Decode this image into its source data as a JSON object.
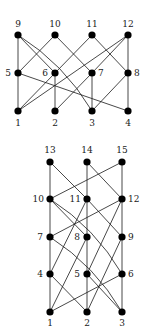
{
  "graphs": [
    {
      "id": "top",
      "nodes": [
        {
          "id": "1",
          "x": 18,
          "y": 111,
          "label": "1",
          "lx": 18,
          "ly": 126,
          "anchor": "middle"
        },
        {
          "id": "2",
          "x": 55,
          "y": 111,
          "label": "2",
          "lx": 55,
          "ly": 126,
          "anchor": "middle"
        },
        {
          "id": "3",
          "x": 92,
          "y": 111,
          "label": "3",
          "lx": 92,
          "ly": 126,
          "anchor": "middle"
        },
        {
          "id": "4",
          "x": 128,
          "y": 111,
          "label": "4",
          "lx": 128,
          "ly": 126,
          "anchor": "middle"
        },
        {
          "id": "5",
          "x": 18,
          "y": 73,
          "label": "5",
          "lx": 11,
          "ly": 76,
          "anchor": "end"
        },
        {
          "id": "6",
          "x": 55,
          "y": 73,
          "label": "6",
          "lx": 48,
          "ly": 76,
          "anchor": "end"
        },
        {
          "id": "7",
          "x": 92,
          "y": 73,
          "label": "7",
          "lx": 98,
          "ly": 76,
          "anchor": "start"
        },
        {
          "id": "8",
          "x": 128,
          "y": 73,
          "label": "8",
          "lx": 134,
          "ly": 76,
          "anchor": "start"
        },
        {
          "id": "9",
          "x": 18,
          "y": 35,
          "label": "9",
          "lx": 18,
          "ly": 27,
          "anchor": "middle"
        },
        {
          "id": "10",
          "x": 55,
          "y": 35,
          "label": "10",
          "lx": 55,
          "ly": 27,
          "anchor": "middle"
        },
        {
          "id": "11",
          "x": 92,
          "y": 35,
          "label": "11",
          "lx": 92,
          "ly": 27,
          "anchor": "middle"
        },
        {
          "id": "12",
          "x": 128,
          "y": 35,
          "label": "12",
          "lx": 128,
          "ly": 27,
          "anchor": "middle"
        }
      ],
      "edges": [
        [
          "9",
          "5"
        ],
        [
          "9",
          "6"
        ],
        [
          "9",
          "3",
          "curve"
        ],
        [
          "10",
          "5"
        ],
        [
          "10",
          "7"
        ],
        [
          "11",
          "6"
        ],
        [
          "11",
          "8"
        ],
        [
          "12",
          "8"
        ],
        [
          "12",
          "7"
        ],
        [
          "12",
          "1"
        ],
        [
          "5",
          "1"
        ],
        [
          "5",
          "4"
        ],
        [
          "6",
          "2"
        ],
        [
          "6",
          "1"
        ],
        [
          "7",
          "3"
        ],
        [
          "7",
          "2"
        ],
        [
          "8",
          "4"
        ],
        [
          "8",
          "3"
        ]
      ]
    },
    {
      "id": "bottom",
      "nodes": [
        {
          "id": "1",
          "x": 50,
          "y": 312,
          "label": "1",
          "lx": 50,
          "ly": 326,
          "anchor": "middle"
        },
        {
          "id": "2",
          "x": 87,
          "y": 312,
          "label": "2",
          "lx": 87,
          "ly": 326,
          "anchor": "middle"
        },
        {
          "id": "3",
          "x": 122,
          "y": 312,
          "label": "3",
          "lx": 122,
          "ly": 326,
          "anchor": "middle"
        },
        {
          "id": "4",
          "x": 50,
          "y": 274,
          "label": "4",
          "lx": 43,
          "ly": 277,
          "anchor": "end"
        },
        {
          "id": "5",
          "x": 87,
          "y": 274,
          "label": "5",
          "lx": 80,
          "ly": 277,
          "anchor": "end"
        },
        {
          "id": "6",
          "x": 122,
          "y": 274,
          "label": "6",
          "lx": 128,
          "ly": 277,
          "anchor": "start"
        },
        {
          "id": "7",
          "x": 50,
          "y": 237,
          "label": "7",
          "lx": 43,
          "ly": 240,
          "anchor": "end"
        },
        {
          "id": "8",
          "x": 87,
          "y": 237,
          "label": "8",
          "lx": 80,
          "ly": 240,
          "anchor": "end"
        },
        {
          "id": "9",
          "x": 122,
          "y": 237,
          "label": "9",
          "lx": 128,
          "ly": 240,
          "anchor": "start"
        },
        {
          "id": "10",
          "x": 50,
          "y": 199,
          "label": "10",
          "lx": 44,
          "ly": 202,
          "anchor": "end"
        },
        {
          "id": "11",
          "x": 87,
          "y": 199,
          "label": "11",
          "lx": 81,
          "ly": 202,
          "anchor": "end"
        },
        {
          "id": "12",
          "x": 122,
          "y": 199,
          "label": "12",
          "lx": 128,
          "ly": 202,
          "anchor": "start"
        },
        {
          "id": "13",
          "x": 50,
          "y": 162,
          "label": "13",
          "lx": 50,
          "ly": 153,
          "anchor": "middle"
        },
        {
          "id": "14",
          "x": 87,
          "y": 162,
          "label": "14",
          "lx": 87,
          "ly": 153,
          "anchor": "middle"
        },
        {
          "id": "15",
          "x": 122,
          "y": 162,
          "label": "15",
          "lx": 122,
          "ly": 153,
          "anchor": "middle"
        }
      ],
      "edges": [
        [
          "13",
          "10"
        ],
        [
          "13",
          "11"
        ],
        [
          "14",
          "11"
        ],
        [
          "14",
          "12"
        ],
        [
          "15",
          "12"
        ],
        [
          "15",
          "10"
        ],
        [
          "10",
          "7"
        ],
        [
          "10",
          "8"
        ],
        [
          "10",
          "6",
          "curve"
        ],
        [
          "11",
          "8"
        ],
        [
          "11",
          "9"
        ],
        [
          "11",
          "4"
        ],
        [
          "12",
          "9"
        ],
        [
          "12",
          "7"
        ],
        [
          "12",
          "5"
        ],
        [
          "7",
          "4"
        ],
        [
          "7",
          "3",
          "curve"
        ],
        [
          "8",
          "5"
        ],
        [
          "8",
          "1"
        ],
        [
          "9",
          "6"
        ],
        [
          "9",
          "2"
        ],
        [
          "4",
          "1"
        ],
        [
          "4",
          "2"
        ],
        [
          "5",
          "2"
        ],
        [
          "5",
          "3"
        ],
        [
          "6",
          "3"
        ],
        [
          "6",
          "1"
        ]
      ]
    }
  ]
}
